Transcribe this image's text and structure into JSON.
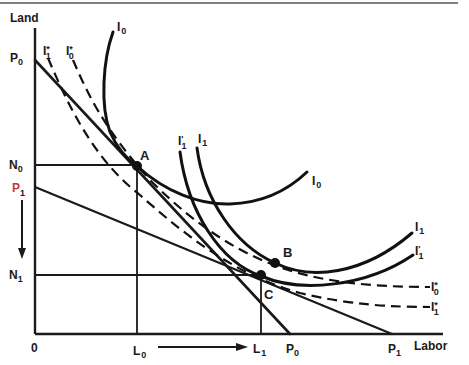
{
  "diagram": {
    "title": "",
    "colors": {
      "ink": "#111111",
      "accent_p1": "#c23a3a",
      "background": "#ffffff"
    },
    "axes": {
      "y_label": "Land",
      "x_label": "Labor",
      "origin": "0",
      "y_axis_path": "M35,28 L35,334",
      "x_axis_path": "M35,334 L443,334"
    },
    "budget_lines": [
      {
        "name": "P0",
        "path": "M35,60 L290,334"
      },
      {
        "name": "P1",
        "path": "M35,187 L392,334"
      }
    ],
    "guides": {
      "n0": "M35,165 L137,165",
      "l0": "M137,165 L137,334",
      "n1": "M35,275 L261,275",
      "l1": "M261,275 L261,334"
    },
    "isoquants": {
      "i0": {
        "style": "solid",
        "path": "M113,32 C103,60 100,105 110,132 C118,150 127,159 137,166 C165,192 200,205 230,204 C262,203 286,192 307,172"
      },
      "i1": {
        "style": "solid",
        "path": "M197,148 C204,200 235,245 275,263 C310,280 362,276 412,233"
      },
      "i1_prime": {
        "style": "solid",
        "path": "M180,152 C188,212 220,262 261,276 C300,293 366,287 413,255"
      },
      "i0_star": {
        "style": "dashed",
        "path": "M73,60 C88,95 105,130 150,180 C200,230 250,262 310,276 C350,285 392,287 430,287"
      },
      "i1_star": {
        "style": "dashed",
        "path": "M48,58 C70,110 95,160 140,195 C188,238 238,276 300,293 C350,305 392,307 430,307"
      }
    },
    "points": [
      {
        "label": "A",
        "cx": 137,
        "cy": 166
      },
      {
        "label": "B",
        "cx": 275,
        "cy": 263
      },
      {
        "label": "C",
        "cx": 261,
        "cy": 275
      }
    ],
    "labels": {
      "p0_y": {
        "main": "P",
        "sub": "0"
      },
      "n0": {
        "main": "N",
        "sub": "0"
      },
      "p1_y": {
        "main": "P",
        "sub": "1"
      },
      "n1": {
        "main": "N",
        "sub": "1"
      },
      "i1_star_top": {
        "main": "I",
        "sup": "*",
        "sub": "1"
      },
      "i0_star_top": {
        "main": "I",
        "sup": "*",
        "sub": "0"
      },
      "i0_top": {
        "main": "I",
        "sub": "0"
      },
      "i1_prime_mid": {
        "main": "I",
        "sup": "'",
        "sub": "1"
      },
      "i1_mid": {
        "main": "I",
        "sub": "1"
      },
      "i0_right": {
        "main": "I",
        "sub": "0"
      },
      "i1_right": {
        "main": "I",
        "sub": "1"
      },
      "i1_prime_right": {
        "main": "I",
        "sup": "'",
        "sub": "1"
      },
      "i0_star_right": {
        "main": "I",
        "sup": "*",
        "sub": "0"
      },
      "i1_star_right": {
        "main": "I",
        "sup": "*",
        "sub": "1"
      },
      "l0": {
        "main": "L",
        "sub": "0"
      },
      "l1": {
        "main": "L",
        "sub": "1"
      },
      "p0_x": {
        "main": "P",
        "sub": "0"
      },
      "p1_x": {
        "main": "P",
        "sub": "1"
      }
    },
    "arrows": {
      "down": {
        "direction": "down",
        "meaning": "land input falls from N0 to N1"
      },
      "right": {
        "direction": "right",
        "meaning": "labor input rises from L0 to L1"
      }
    }
  }
}
